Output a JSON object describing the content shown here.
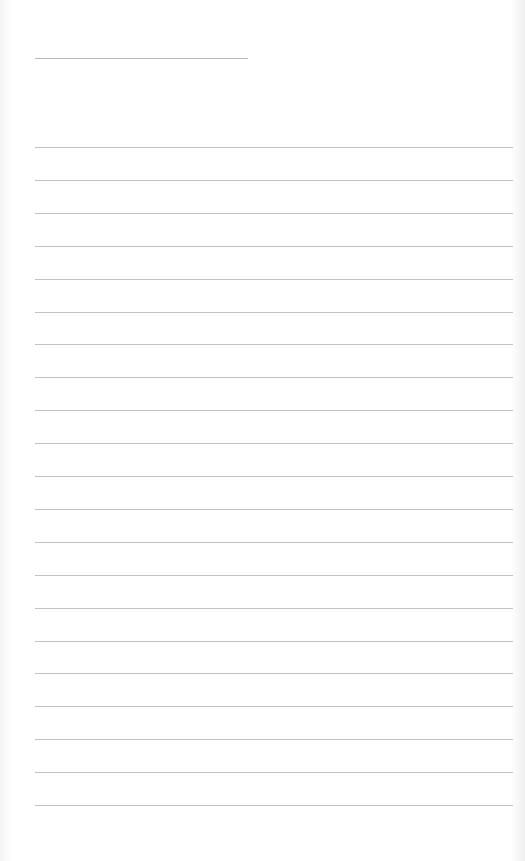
{
  "page": {
    "type": "blank lined paper",
    "title_line": {
      "x": 35,
      "y": 58,
      "width": 213
    },
    "rules": {
      "count": 21,
      "first_y": 147,
      "spacing": 32.9,
      "x": 35,
      "width": 478
    },
    "colors": {
      "paper": "#fefefe",
      "line": "#c2c2c2"
    }
  }
}
